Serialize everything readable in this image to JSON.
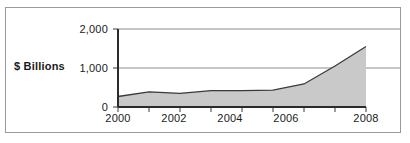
{
  "figure": {
    "clipped_caption_above": "",
    "border_color": "#9a9a9a",
    "background": "#ffffff"
  },
  "chart_data": {
    "type": "area",
    "title": "",
    "xlabel": "",
    "ylabel": "$ Billions",
    "x": [
      2000,
      2001,
      2002,
      2003,
      2004,
      2005,
      2006,
      2007,
      2008
    ],
    "values": [
      270,
      390,
      350,
      420,
      420,
      430,
      590,
      1050,
      1550
    ],
    "categories": [
      "2000",
      "2001",
      "2002",
      "2003",
      "2004",
      "2005",
      "2006",
      "2007",
      "2008"
    ],
    "xlim": [
      2000,
      2008
    ],
    "ylim": [
      0,
      2000
    ],
    "ytick_values": [
      0,
      1000,
      2000
    ],
    "ytick_labels": [
      "0",
      "1,000",
      "2,000"
    ],
    "xtick_values": [
      2000,
      2001,
      2002,
      2003,
      2004,
      2005,
      2006,
      2007,
      2008
    ],
    "xtick_labels": [
      "2000",
      "",
      "2002",
      "",
      "2004",
      "",
      "2006",
      "",
      "2008"
    ],
    "xtick_labels_shown": [
      "2000",
      "2002",
      "2004",
      "2006",
      "2008"
    ],
    "grid": "horizontal",
    "grid_color": "#8c8c8c",
    "legend": null,
    "series": [
      {
        "name": "$ Billions",
        "fill_color": "#c9c9c9",
        "line_color": "#3a3a3a",
        "values": [
          270,
          390,
          350,
          420,
          420,
          430,
          590,
          1050,
          1550
        ]
      }
    ]
  }
}
